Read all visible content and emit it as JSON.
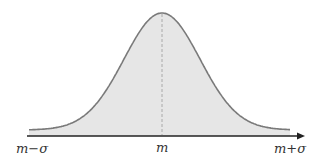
{
  "figure": {
    "colors": {
      "fill": "#e6e6e6",
      "curve": "#7a7a7a",
      "axis": "#222222",
      "mean_line": "#9a9a9a"
    }
  },
  "axis": {
    "labels": {
      "left": "m−σ",
      "center": "m",
      "right": "m+σ"
    }
  }
}
